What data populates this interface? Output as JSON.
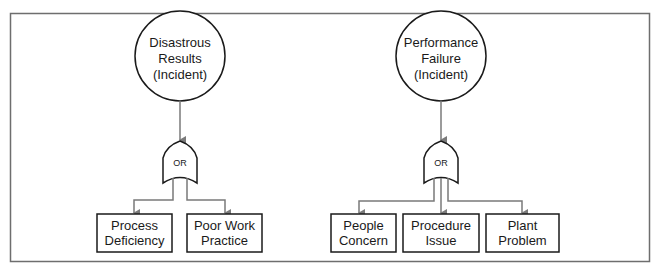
{
  "diagram": {
    "type": "fault-tree",
    "colors": {
      "frame": "#6e6e6e",
      "node_stroke": "#1a1a1a",
      "connector": "#7a7a7a",
      "background": "#ffffff"
    },
    "trees": [
      {
        "top_event": {
          "lines": [
            "Disastrous",
            "Results",
            "(Incident)"
          ]
        },
        "gate": {
          "label": "OR"
        },
        "children": [
          {
            "lines": [
              "Process",
              "Deficiency"
            ]
          },
          {
            "lines": [
              "Poor Work",
              "Practice"
            ]
          }
        ]
      },
      {
        "top_event": {
          "lines": [
            "Performance",
            "Failure",
            "(Incident)"
          ]
        },
        "gate": {
          "label": "OR"
        },
        "children": [
          {
            "lines": [
              "People",
              "Concern"
            ]
          },
          {
            "lines": [
              "Procedure",
              "Issue"
            ]
          },
          {
            "lines": [
              "Plant",
              "Problem"
            ]
          }
        ]
      }
    ]
  }
}
